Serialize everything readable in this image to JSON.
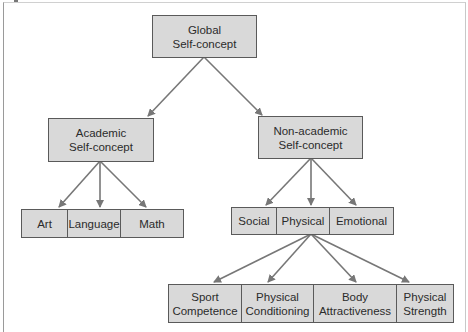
{
  "diagram": {
    "type": "hierarchy",
    "colors": {
      "box_fill": "#d9d9d9",
      "box_border": "#5a5a5a",
      "arrow": "#777777"
    },
    "root": {
      "label": "Global\nSelf-concept"
    },
    "level1": [
      {
        "label": "Academic\nSelf-concept"
      },
      {
        "label": "Non-academic\nSelf-concept"
      }
    ],
    "academic_children": [
      "Art",
      "Language",
      "Math"
    ],
    "nonacademic_children": [
      "Social",
      "Physical",
      "Emotional"
    ],
    "physical_children": [
      "Sport\nCompetence",
      "Physical\nConditioning",
      "Body\nAttractiveness",
      "Physical\nStrength"
    ]
  }
}
